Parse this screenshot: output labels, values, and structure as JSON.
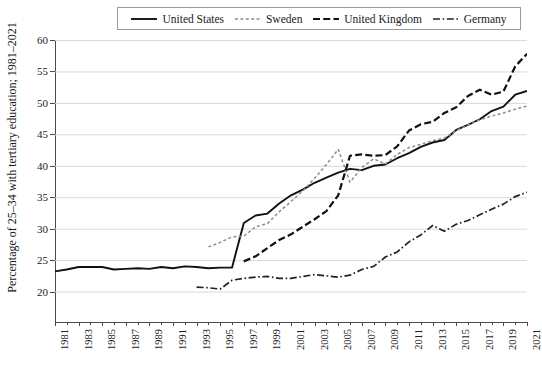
{
  "chart": {
    "type": "line",
    "title": "",
    "ylabel": "Percentage of 25–34 with tertiary education; 1981–2021",
    "xlabel": "",
    "background": "#ffffff",
    "grid": true,
    "legend_position": "top-center"
  },
  "axes": {
    "y": {
      "min": 15,
      "max": 60,
      "ticks": [
        60,
        55,
        50,
        45,
        40,
        35,
        30,
        25,
        20
      ],
      "tick_labels": [
        "60",
        "55",
        "50",
        "45",
        "40",
        "35",
        "30",
        "25",
        "20"
      ]
    },
    "x": {
      "min": 1981,
      "max": 2021,
      "ticks": [
        1981,
        1983,
        1985,
        1987,
        1989,
        1991,
        1993,
        1995,
        1997,
        1999,
        2001,
        2003,
        2005,
        2007,
        2009,
        2011,
        2013,
        2015,
        2017,
        2019,
        2021
      ],
      "tick_labels": [
        "1981",
        "1983",
        "1985",
        "1987",
        "1989",
        "1991",
        "1993",
        "1995",
        "1997",
        "1999",
        "2001",
        "2003",
        "2005",
        "2007",
        "2009",
        "2011",
        "2013",
        "2015",
        "2017",
        "2019",
        "2021"
      ],
      "minor_ticks": [
        1982,
        1984,
        1986,
        1988,
        1990,
        1992,
        1994,
        1996,
        1998,
        2000,
        2002,
        2004,
        2006,
        2008,
        2010,
        2012,
        2014,
        2016,
        2018,
        2020
      ]
    }
  },
  "legend": {
    "entries": [
      {
        "label": "United States",
        "style": "solid",
        "color": "#111111",
        "icon": "line-solid-icon"
      },
      {
        "label": "Sweden",
        "style": "dotted",
        "color": "#8d8d8d",
        "icon": "line-dotted-icon"
      },
      {
        "label": "United Kingdom",
        "style": "dashed",
        "color": "#111111",
        "icon": "line-dashed-icon"
      },
      {
        "label": "Germany",
        "style": "dash-dot",
        "color": "#222222",
        "icon": "line-dashdot-icon"
      }
    ]
  },
  "chart_data": {
    "type": "line",
    "title": "",
    "xlabel": "",
    "ylabel": "Percentage of 25–34 with tertiary education; 1981–2021",
    "ylim": [
      15,
      60
    ],
    "xlim": [
      1981,
      2021
    ],
    "grid": true,
    "legend_position": "top-center",
    "x": [
      1981,
      1982,
      1983,
      1984,
      1985,
      1986,
      1987,
      1988,
      1989,
      1990,
      1991,
      1992,
      1993,
      1994,
      1995,
      1996,
      1997,
      1998,
      1999,
      2000,
      2001,
      2002,
      2003,
      2004,
      2005,
      2006,
      2007,
      2008,
      2009,
      2010,
      2011,
      2012,
      2013,
      2014,
      2015,
      2016,
      2017,
      2018,
      2019,
      2020,
      2021
    ],
    "series": [
      {
        "name": "United States",
        "style": "solid",
        "color": "#111111",
        "x": [
          1981,
          1982,
          1983,
          1984,
          1985,
          1986,
          1987,
          1988,
          1989,
          1990,
          1991,
          1992,
          1993,
          1994,
          1995,
          1996,
          1997,
          1998,
          1999,
          2000,
          2001,
          2002,
          2003,
          2004,
          2005,
          2006,
          2007,
          2008,
          2009,
          2010,
          2011,
          2012,
          2013,
          2014,
          2015,
          2016,
          2017,
          2018,
          2019,
          2020,
          2021
        ],
        "values": [
          23.2,
          23.5,
          23.9,
          23.9,
          23.9,
          23.5,
          23.6,
          23.7,
          23.6,
          23.9,
          23.7,
          24.0,
          23.9,
          23.7,
          23.8,
          23.8,
          30.9,
          32.1,
          32.4,
          34.0,
          35.3,
          36.2,
          37.3,
          38.1,
          38.9,
          39.5,
          39.3,
          40.0,
          40.2,
          41.2,
          42.0,
          43.0,
          43.7,
          44.1,
          45.7,
          46.5,
          47.4,
          48.7,
          49.4,
          51.3,
          51.9
        ]
      },
      {
        "name": "Sweden",
        "style": "dotted",
        "color": "#8d8d8d",
        "x": [
          1994,
          1995,
          1996,
          1997,
          1998,
          1999,
          2000,
          2001,
          2002,
          2003,
          2004,
          2005,
          2006,
          2007,
          2008,
          2009,
          2010,
          2011,
          2012,
          2013,
          2014,
          2015,
          2016,
          2017,
          2018,
          2019,
          2020,
          2021
        ],
        "values": [
          27.1,
          27.8,
          28.7,
          28.8,
          30.3,
          30.8,
          32.7,
          34.3,
          36.0,
          38.0,
          40.2,
          42.6,
          37.4,
          39.7,
          41.1,
          40.3,
          41.8,
          42.9,
          43.4,
          44.0,
          44.4,
          45.6,
          46.5,
          47.3,
          47.9,
          48.4,
          49.0,
          49.5
        ]
      },
      {
        "name": "United Kingdom",
        "style": "dashed",
        "color": "#111111",
        "x": [
          1997,
          1998,
          1999,
          2000,
          2001,
          2002,
          2003,
          2004,
          2005,
          2006,
          2007,
          2008,
          2009,
          2010,
          2011,
          2012,
          2013,
          2014,
          2015,
          2016,
          2017,
          2018,
          2019,
          2020,
          2021
        ],
        "values": [
          24.8,
          25.6,
          26.9,
          28.2,
          29.1,
          30.3,
          31.5,
          32.8,
          35.3,
          41.6,
          41.8,
          41.6,
          41.7,
          43.1,
          45.6,
          46.6,
          47.0,
          48.4,
          49.3,
          51.1,
          52.1,
          51.3,
          51.8,
          55.8,
          57.8
        ]
      },
      {
        "name": "Germany",
        "style": "dash-dot",
        "color": "#222222",
        "x": [
          1993,
          1994,
          1995,
          1996,
          1997,
          1998,
          1999,
          2000,
          2001,
          2002,
          2003,
          2004,
          2005,
          2006,
          2007,
          2008,
          2009,
          2010,
          2011,
          2012,
          2013,
          2014,
          2015,
          2016,
          2017,
          2018,
          2019,
          2020,
          2021
        ],
        "values": [
          20.7,
          20.6,
          20.4,
          21.8,
          22.1,
          22.3,
          22.4,
          22.1,
          22.1,
          22.4,
          22.7,
          22.5,
          22.3,
          22.6,
          23.5,
          24.0,
          25.5,
          26.3,
          27.9,
          29.0,
          30.5,
          29.6,
          30.7,
          31.3,
          32.2,
          33.1,
          33.9,
          35.1,
          35.8
        ]
      }
    ]
  }
}
